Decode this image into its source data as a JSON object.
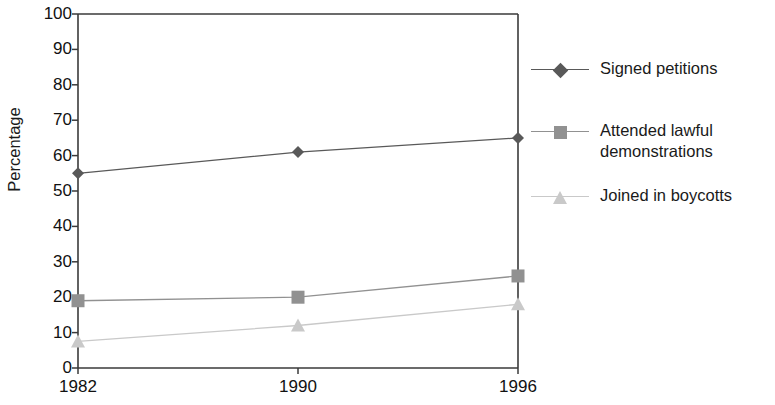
{
  "chart_data": {
    "type": "line",
    "title": "",
    "subtitle": "",
    "xlabel": "",
    "ylabel": "Percentage",
    "categories": [
      "1982",
      "1990",
      "1996"
    ],
    "x": [
      1982,
      1990,
      1996
    ],
    "ylim": [
      0,
      100
    ],
    "ytick_step": 10,
    "yticks": [
      "100",
      "90",
      "80",
      "70",
      "60",
      "50",
      "40",
      "30",
      "20",
      "10",
      "0"
    ],
    "grid": false,
    "legend_position": "right",
    "series": [
      {
        "name": "Signed petitions",
        "marker": "diamond",
        "color": "#595959",
        "values": [
          55,
          61,
          65
        ]
      },
      {
        "name": "Attended lawful\ndemonstrations",
        "marker": "square",
        "color": "#919191",
        "values": [
          19,
          20,
          26
        ]
      },
      {
        "name": "Joined in boycotts",
        "marker": "triangle",
        "color": "#c9c9c9",
        "values": [
          7.5,
          12,
          18
        ]
      }
    ],
    "axis_color": "#3a3a3a"
  }
}
